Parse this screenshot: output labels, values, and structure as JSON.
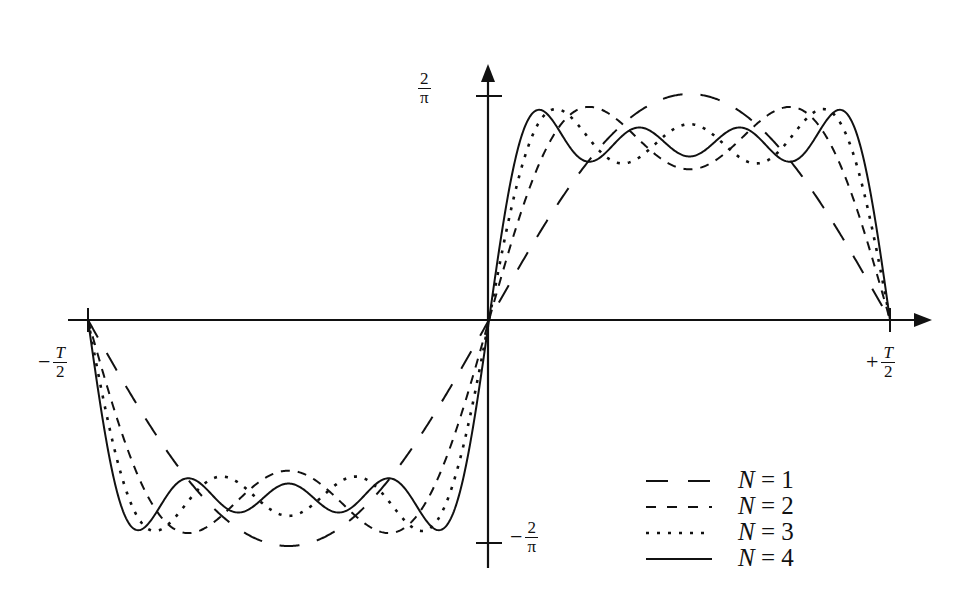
{
  "chart_data": {
    "type": "line",
    "title": "",
    "xlabel": "",
    "ylabel": "",
    "x_range": [
      "-T/2",
      "+T/2"
    ],
    "y_range": [
      "-2/pi",
      "2/pi"
    ],
    "x_ticks": [
      {
        "pos": "-T/2",
        "label": "-T/2"
      },
      {
        "pos": "+T/2",
        "label": "+T/2"
      }
    ],
    "y_ticks": [
      {
        "pos": "2/pi",
        "label": "2/π"
      },
      {
        "pos": "-2/pi",
        "label": "-2/π"
      }
    ],
    "grid": false,
    "legend_position": "lower right",
    "series": [
      {
        "name": "N = 1",
        "style": "long-dash",
        "terms": 1
      },
      {
        "name": "N = 2",
        "style": "short-dash",
        "terms": 2
      },
      {
        "name": "N = 3",
        "style": "dotted",
        "terms": 3
      },
      {
        "name": "N = 4",
        "style": "solid",
        "terms": 4
      }
    ]
  },
  "axes": {
    "y_top_label": {
      "num": "2",
      "den": "π"
    },
    "y_bottom_label": {
      "sign": "−",
      "num": "2",
      "den": "π"
    },
    "x_left_label": {
      "sign": "−",
      "num": "T",
      "den": "2"
    },
    "x_right_label": {
      "sign": "+",
      "num": "T",
      "den": "2"
    }
  },
  "legend": [
    {
      "var": "N",
      "eq": " = ",
      "val": "1"
    },
    {
      "var": "N",
      "eq": " = ",
      "val": "2"
    },
    {
      "var": "N",
      "eq": " = ",
      "val": "3"
    },
    {
      "var": "N",
      "eq": " = ",
      "val": "4"
    }
  ]
}
